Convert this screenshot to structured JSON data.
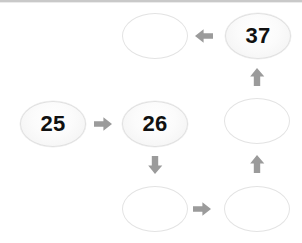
{
  "canvas": {
    "width": 302,
    "height": 243,
    "background": "#ffffff",
    "top_rule_color": "#c9c9c9"
  },
  "style": {
    "node_fill_empty": "#ffffff",
    "node_fill_filled": "#f3f3f3",
    "node_border": "#e3e3e3",
    "node_text_color": "#111111",
    "arrow_color": "#9b9b9b"
  },
  "diagram": {
    "type": "grid-path",
    "columns": 3,
    "rows": 3,
    "nodes": [
      {
        "id": "r0c1",
        "row": 0,
        "col": 1,
        "label": "",
        "filled": false
      },
      {
        "id": "r0c2",
        "row": 0,
        "col": 2,
        "label": "37",
        "filled": true
      },
      {
        "id": "r1c0",
        "row": 1,
        "col": 0,
        "label": "25",
        "filled": true
      },
      {
        "id": "r1c1",
        "row": 1,
        "col": 1,
        "label": "26",
        "filled": true
      },
      {
        "id": "r1c2",
        "row": 1,
        "col": 2,
        "label": "",
        "filled": false
      },
      {
        "id": "r2c1",
        "row": 2,
        "col": 1,
        "label": "",
        "filled": false
      },
      {
        "id": "r2c2",
        "row": 2,
        "col": 2,
        "label": "",
        "filled": false
      }
    ],
    "arrows": [
      {
        "id": "a1",
        "from": "r1c0",
        "to": "r1c1",
        "direction": "right"
      },
      {
        "id": "a2",
        "from": "r1c1",
        "to": "r2c1",
        "direction": "down"
      },
      {
        "id": "a3",
        "from": "r2c1",
        "to": "r2c2",
        "direction": "right"
      },
      {
        "id": "a4",
        "from": "r2c2",
        "to": "r1c2",
        "direction": "up"
      },
      {
        "id": "a5",
        "from": "r1c2",
        "to": "r0c2",
        "direction": "up"
      },
      {
        "id": "a6",
        "from": "r0c2",
        "to": "r0c1",
        "direction": "left"
      }
    ]
  }
}
